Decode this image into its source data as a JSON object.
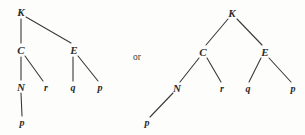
{
  "figure": {
    "type": "two-alternative-tree-diagrams",
    "background_color": "#fdfdfc",
    "stroke_color": "#3a3a3a",
    "text_color": "#2b2b2b",
    "connector": {
      "text": "or",
      "x": 137,
      "y": 58
    },
    "trees": [
      {
        "id": "left-tree",
        "name": "left-derivation-tree",
        "root": "K",
        "nodes": [
          {
            "id": "L-K",
            "label": "K",
            "case": "cap",
            "x": 21,
            "y": 12
          },
          {
            "id": "L-C",
            "label": "C",
            "case": "cap",
            "x": 21,
            "y": 50
          },
          {
            "id": "L-E",
            "label": "E",
            "case": "cap",
            "x": 74,
            "y": 50
          },
          {
            "id": "L-N",
            "label": "N",
            "case": "cap",
            "x": 21,
            "y": 87
          },
          {
            "id": "L-r",
            "label": "r",
            "case": "low",
            "x": 46,
            "y": 88
          },
          {
            "id": "L-q",
            "label": "q",
            "case": "low",
            "x": 73,
            "y": 88
          },
          {
            "id": "L-p1",
            "label": "p",
            "case": "low",
            "x": 100,
            "y": 88
          },
          {
            "id": "L-p2",
            "label": "p",
            "case": "low",
            "x": 22,
            "y": 123
          }
        ],
        "edges": [
          {
            "from": "L-K",
            "to": "L-C",
            "x1": 21,
            "y1": 19,
            "x2": 21,
            "y2": 43
          },
          {
            "from": "L-K",
            "to": "L-E",
            "x1": 26,
            "y1": 17,
            "x2": 71,
            "y2": 43
          },
          {
            "from": "L-C",
            "to": "L-N",
            "x1": 21,
            "y1": 57,
            "x2": 21,
            "y2": 80
          },
          {
            "from": "L-C",
            "to": "L-r",
            "x1": 25,
            "y1": 56,
            "x2": 43,
            "y2": 81
          },
          {
            "from": "L-E",
            "to": "L-q",
            "x1": 73,
            "y1": 57,
            "x2": 73,
            "y2": 81
          },
          {
            "from": "L-E",
            "to": "L-p1",
            "x1": 78,
            "y1": 56,
            "x2": 98,
            "y2": 81
          },
          {
            "from": "L-N",
            "to": "L-p2",
            "x1": 21,
            "y1": 93,
            "x2": 22,
            "y2": 116
          }
        ]
      },
      {
        "id": "right-tree",
        "name": "right-derivation-tree",
        "root": "K",
        "nodes": [
          {
            "id": "R-K",
            "label": "K",
            "case": "cap",
            "x": 232,
            "y": 13
          },
          {
            "id": "R-C",
            "label": "C",
            "case": "cap",
            "x": 203,
            "y": 52
          },
          {
            "id": "R-E",
            "label": "E",
            "case": "cap",
            "x": 265,
            "y": 52
          },
          {
            "id": "R-N",
            "label": "N",
            "case": "cap",
            "x": 177,
            "y": 88
          },
          {
            "id": "R-r",
            "label": "r",
            "case": "low",
            "x": 222,
            "y": 89
          },
          {
            "id": "R-q",
            "label": "q",
            "case": "low",
            "x": 248,
            "y": 89
          },
          {
            "id": "R-p1",
            "label": "p",
            "case": "low",
            "x": 293,
            "y": 89
          },
          {
            "id": "R-p2",
            "label": "p",
            "case": "low",
            "x": 147,
            "y": 123
          }
        ],
        "edges": [
          {
            "from": "R-K",
            "to": "R-C",
            "x1": 228,
            "y1": 19,
            "x2": 206,
            "y2": 45
          },
          {
            "from": "R-K",
            "to": "R-E",
            "x1": 237,
            "y1": 19,
            "x2": 262,
            "y2": 45
          },
          {
            "from": "R-C",
            "to": "R-N",
            "x1": 199,
            "y1": 58,
            "x2": 180,
            "y2": 82
          },
          {
            "from": "R-C",
            "to": "R-r",
            "x1": 207,
            "y1": 58,
            "x2": 221,
            "y2": 82
          },
          {
            "from": "R-E",
            "to": "R-q",
            "x1": 261,
            "y1": 58,
            "x2": 249,
            "y2": 82
          },
          {
            "from": "R-E",
            "to": "R-p1",
            "x1": 269,
            "y1": 58,
            "x2": 291,
            "y2": 82
          },
          {
            "from": "R-N",
            "to": "R-p2",
            "x1": 173,
            "y1": 93,
            "x2": 150,
            "y2": 117
          }
        ]
      }
    ]
  }
}
